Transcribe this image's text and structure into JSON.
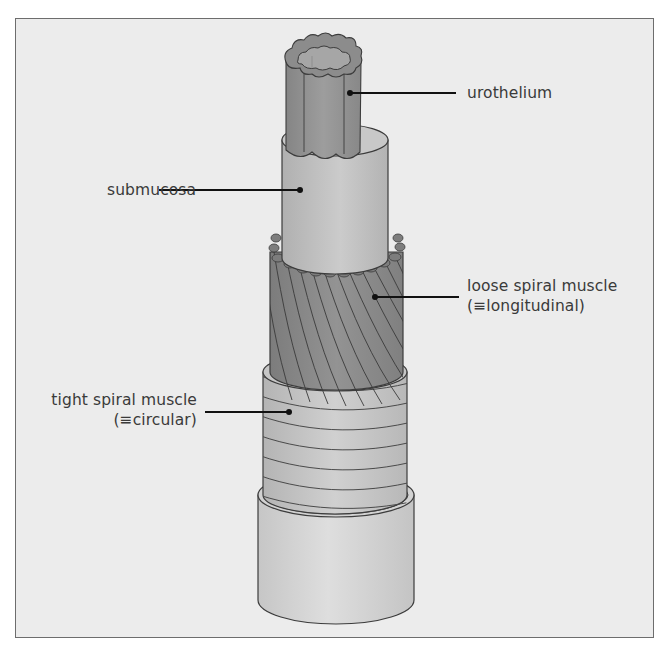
{
  "figure": {
    "colors": {
      "background": "#ececec",
      "frame_border": "#6d6d6d",
      "urothelium": "#8f8f8f",
      "submucosa": "#bdbdbd",
      "loose_spiral_muscle": "#8a8a8a",
      "tight_spiral_muscle": "#c2c2c2",
      "adventitia": "#d4d4d4",
      "outline": "#3c3c3c",
      "leader": "#111111",
      "text": "#3a3a3a"
    }
  },
  "labels": {
    "urothelium": {
      "line1": "urothelium"
    },
    "submucosa": {
      "line1": "submucosa"
    },
    "loose_spiral_muscle": {
      "line1": "loose spiral muscle",
      "line2": "(≡longitudinal)"
    },
    "tight_spiral_muscle": {
      "line1": "tight spiral muscle",
      "line2": "(≡circular)"
    }
  }
}
